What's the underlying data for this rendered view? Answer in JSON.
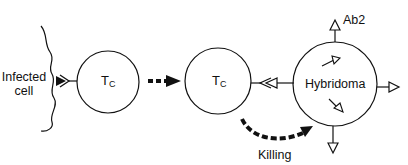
{
  "diagram": {
    "title": "",
    "nodes": [
      {
        "id": "infected-cell",
        "label_line1": "Infected",
        "label_line2": "cell",
        "shape": "wavy-membrane"
      },
      {
        "id": "tc-1",
        "label_main": "T",
        "label_sub": "C",
        "shape": "circle"
      },
      {
        "id": "tc-2",
        "label_main": "T",
        "label_sub": "C",
        "shape": "circle"
      },
      {
        "id": "hybridoma",
        "label": "Hybridoma",
        "shape": "circle"
      }
    ],
    "edges": [
      {
        "from": "tc-1",
        "to": "tc-2",
        "style": "dashed-bold-arrow"
      },
      {
        "from": "tc-2",
        "to": "hybridoma",
        "style": "dashed-bold-curved-arrow",
        "label": "Killing"
      }
    ],
    "annotations": {
      "ab2_label": "Ab2",
      "killing_label": "Killing"
    },
    "colors": {
      "stroke": "#111111",
      "background": "#ffffff"
    }
  }
}
